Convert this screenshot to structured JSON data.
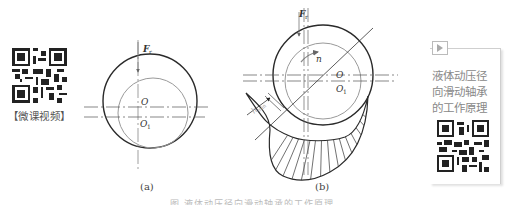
{
  "left_qr": {
    "icon": "qr-code-icon",
    "caption": "【微课视频】"
  },
  "figure_a": {
    "label": "(a)",
    "force_label": "F",
    "force_subscript": "r",
    "center_bearing": "O",
    "center_journal": "O",
    "center_journal_subscript": "1"
  },
  "figure_b": {
    "label": "(b)",
    "force_label": "F",
    "force_subscript": "r",
    "rotation_label": "n",
    "center_bearing": "O",
    "center_journal": "O",
    "center_journal_subscript": "1",
    "min_film_label": "h",
    "min_film_subscript": "min"
  },
  "caption": "图 液体动压径向滑动轴承的工作原理",
  "right_card": {
    "play_icon": "play-icon",
    "lines": [
      "液体动压径",
      "向滑动轴承",
      "的工作原理"
    ],
    "qr_icon": "qr-code-icon"
  },
  "colors": {
    "outline": "#2a2a2a",
    "inner_circle": "#999999",
    "text_gray": "#888888"
  }
}
